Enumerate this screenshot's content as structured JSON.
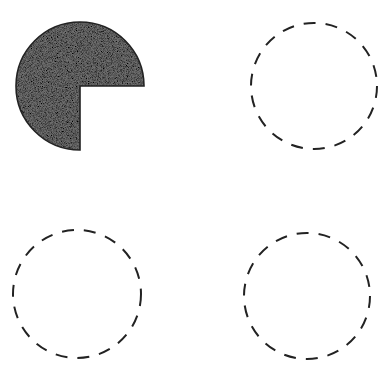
{
  "diagram": {
    "background": "#ffffff",
    "stroke_color": "#222222",
    "fill_color": "#6e6e6e",
    "shapes": [
      {
        "id": "pie-three-quarters",
        "type": "pie",
        "position": "top-left",
        "cx": 80,
        "cy": 86,
        "r": 64,
        "filled_fraction": 0.75,
        "missing_quadrant": "bottom-right",
        "fill": "stippled-gray",
        "stroke": "solid"
      },
      {
        "id": "circle-top-right",
        "type": "circle",
        "position": "top-right",
        "cx": 314,
        "cy": 86,
        "r": 63,
        "fill": "none",
        "stroke": "dashed"
      },
      {
        "id": "circle-bottom-left",
        "type": "circle",
        "position": "bottom-left",
        "cx": 77,
        "cy": 294,
        "r": 64,
        "fill": "none",
        "stroke": "dashed"
      },
      {
        "id": "circle-bottom-right",
        "type": "circle",
        "position": "bottom-right",
        "cx": 307,
        "cy": 296,
        "r": 63,
        "fill": "none",
        "stroke": "dashed"
      }
    ]
  }
}
